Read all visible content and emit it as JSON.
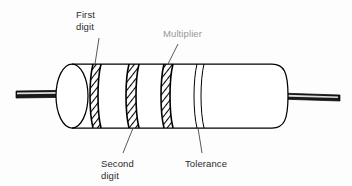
{
  "figure": {
    "background_color": "#fdfdfd",
    "line_color": "#000000",
    "text_color": "#2b2b2b"
  },
  "labels": {
    "first_digit": {
      "line1": "First",
      "line2": "digit",
      "position": "top-left",
      "points_to": "band-1"
    },
    "multiplier": {
      "line1": "Multiplier",
      "position": "top-center",
      "points_to": "band-3",
      "render_quality": "degraded"
    },
    "second_digit": {
      "line1": "Second",
      "line2": "digit",
      "position": "bottom-left",
      "points_to": "band-2"
    },
    "tolerance": {
      "line1": "Tolerance",
      "position": "bottom-center",
      "points_to": "band-4"
    }
  },
  "resistor": {
    "bands": [
      {
        "id": "band-1",
        "role": "first digit",
        "fill": "hatched"
      },
      {
        "id": "band-2",
        "role": "second digit",
        "fill": "hatched"
      },
      {
        "id": "band-3",
        "role": "multiplier",
        "fill": "hatched"
      },
      {
        "id": "band-4",
        "role": "tolerance",
        "fill": "plain"
      }
    ],
    "leads": [
      {
        "id": "lead-left",
        "side": "left"
      },
      {
        "id": "lead-right",
        "side": "right"
      }
    ]
  }
}
